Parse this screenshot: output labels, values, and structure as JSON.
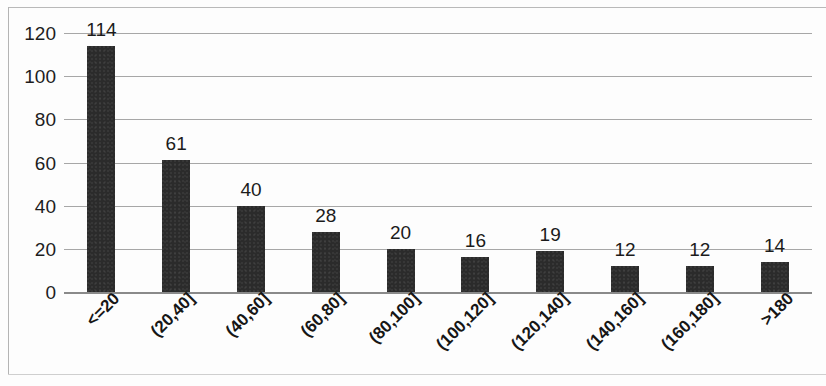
{
  "chart_data": {
    "type": "bar",
    "title": "",
    "subtitle": "",
    "xlabel": "",
    "ylabel": "",
    "categories": [
      "<=20",
      "(20,40]",
      "(40,60]",
      "(60,80]",
      "(80,100]",
      "(100,120]",
      "(120,140]",
      "(140,160]",
      "(160,180]",
      ">180"
    ],
    "values": [
      114,
      61,
      40,
      28,
      20,
      16,
      19,
      12,
      12,
      14
    ],
    "data_labels": [
      "114",
      "61",
      "40",
      "28",
      "20",
      "16",
      "19",
      "12",
      "12",
      "14"
    ],
    "ylim": [
      0,
      120
    ],
    "yticks": [
      0,
      20,
      40,
      60,
      80,
      100,
      120
    ],
    "ytick_labels": [
      "0",
      "20",
      "40",
      "60",
      "80",
      "100",
      "120"
    ],
    "grid": true,
    "grid_axis": "y",
    "legend": false,
    "legend_position": "none",
    "bar_color": "#2b2b2b",
    "gridline_color": "#a7a7a7",
    "axis_color": "#8a8a8a",
    "background_color": "#fdfdfd",
    "xtick_rotation": -45
  }
}
